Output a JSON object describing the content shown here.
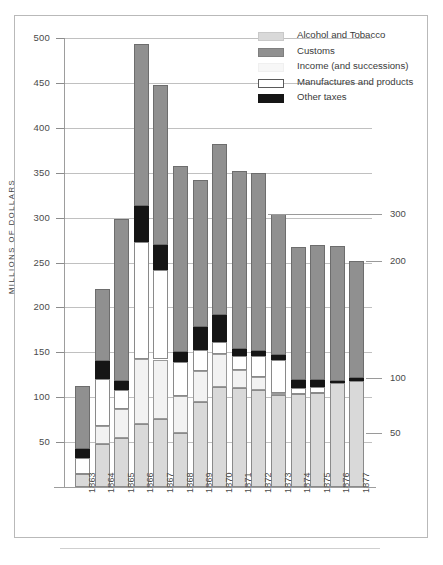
{
  "chart_data": {
    "type": "bar",
    "subtype": "stacked-bar",
    "title": "",
    "xlabel": "",
    "ylabel": "MILLIONS OF DOLLARS",
    "ylim": [
      0,
      500
    ],
    "ytick_step": 50,
    "yticks": [
      50,
      100,
      150,
      200,
      250,
      300,
      350,
      400,
      450,
      500
    ],
    "grid": true,
    "legend_position": "top-right",
    "categories": [
      "1863",
      "1864",
      "1865",
      "1866",
      "1867",
      "1868",
      "1869",
      "1870",
      "1871",
      "1872",
      "1873",
      "1874",
      "1875",
      "1876",
      "1877"
    ],
    "series": [
      {
        "name": "Alcohol and Tobacco",
        "color": "#d9d9d9",
        "values": [
          15,
          48,
          55,
          70,
          76,
          60,
          95,
          111,
          110,
          108,
          102,
          104,
          105,
          116,
          118
        ]
      },
      {
        "name": "Customs",
        "color": "#909090",
        "values": [
          70,
          80,
          180,
          180,
          178,
          208,
          164,
          190,
          198,
          198,
          157,
          148,
          150,
          150,
          131
        ]
      },
      {
        "name": "Income (and successions)",
        "color": "#f2f2f2",
        "values": [
          0,
          20,
          32,
          73,
          66,
          41,
          34,
          37,
          20,
          14,
          3,
          0,
          0,
          0,
          0
        ]
      },
      {
        "name": "Manufactures and products",
        "color": "#ffffff",
        "values": [
          17,
          52,
          21,
          130,
          100,
          38,
          24,
          13,
          16,
          24,
          36,
          6,
          6,
          0,
          0
        ]
      },
      {
        "name": "Other taxes",
        "color": "#151515",
        "values": [
          10,
          20,
          10,
          40,
          28,
          11,
          25,
          31,
          8,
          6,
          6,
          9,
          8,
          2,
          3
        ]
      }
    ],
    "annotations": [
      {
        "label": "300",
        "value": 300,
        "target": "1872"
      },
      {
        "label": "200",
        "value": 200,
        "target": "1877"
      },
      {
        "label": "100",
        "value": 100,
        "target": "1877"
      },
      {
        "label": "50",
        "value": 50,
        "target": "1877"
      }
    ],
    "totals": [
      112,
      220,
      298,
      493,
      448,
      358,
      342,
      382,
      352,
      350,
      304,
      267,
      269,
      268,
      252
    ]
  },
  "axis": {
    "y_label": "MILLIONS OF DOLLARS",
    "y_ticks": [
      "500",
      "450",
      "400",
      "350",
      "300",
      "250",
      "200",
      "150",
      "100",
      "50"
    ],
    "x_ticks": [
      "1863",
      "1864",
      "1865",
      "1866",
      "1867",
      "1868",
      "1869",
      "1870",
      "1871",
      "1872",
      "1873",
      "1874",
      "1875",
      "1876",
      "1877"
    ]
  },
  "legend": {
    "items": [
      {
        "label": "Alcohol and Tobacco",
        "key": "alcohol"
      },
      {
        "label": "Customs",
        "key": "customs"
      },
      {
        "label": "Income (and successions)",
        "key": "income"
      },
      {
        "label": "Manufactures and products",
        "key": "manuf"
      },
      {
        "label": "Other taxes",
        "key": "other"
      }
    ]
  },
  "right_annotations": [
    {
      "label": "300"
    },
    {
      "label": "200"
    },
    {
      "label": "100"
    },
    {
      "label": "50"
    }
  ],
  "caption": ""
}
